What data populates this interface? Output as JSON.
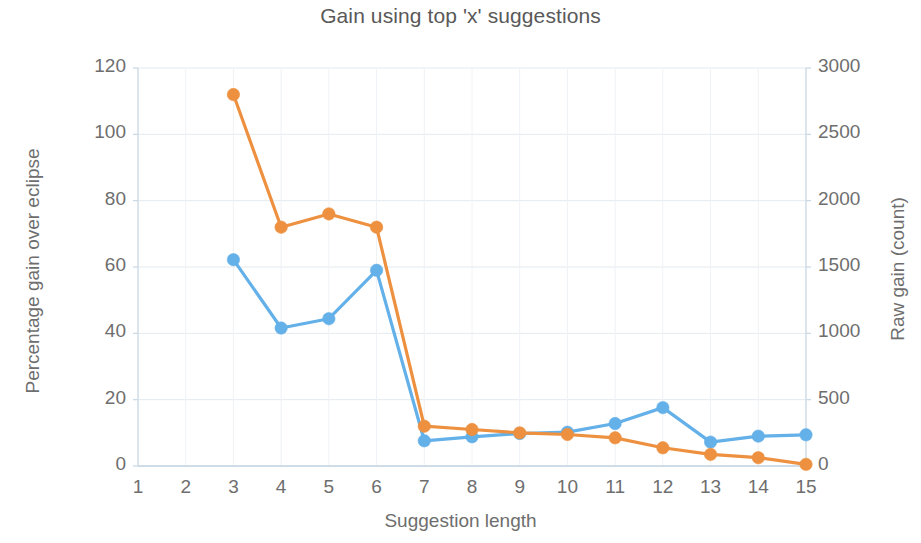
{
  "chart_data": {
    "type": "line",
    "title": "Gain using top 'x' suggestions",
    "xlabel": "Suggestion length",
    "ylabel": "Percentage gain over eclipse",
    "y2label": "Raw gain (count)",
    "x": [
      1,
      2,
      3,
      4,
      5,
      6,
      7,
      8,
      9,
      10,
      11,
      12,
      13,
      14,
      15
    ],
    "xticklabels": [
      "1",
      "2",
      "3",
      "4",
      "5",
      "6",
      "7",
      "8",
      "9",
      "10",
      "11",
      "12",
      "13",
      "14",
      "15"
    ],
    "xlim": [
      1,
      15
    ],
    "ylim": [
      0,
      120
    ],
    "yticks": [
      0,
      20,
      40,
      60,
      80,
      100,
      120
    ],
    "yticklabels": [
      "0",
      "20",
      "40",
      "60",
      "80",
      "100",
      "120"
    ],
    "y2lim": [
      0,
      3000
    ],
    "y2ticks": [
      0,
      500,
      1000,
      1500,
      2000,
      2500,
      3000
    ],
    "y2ticklabels": [
      "0",
      "500",
      "1000",
      "1500",
      "2000",
      "2500",
      "3000"
    ],
    "grid": true,
    "legend": "none",
    "series": [
      {
        "name": "Percentage gain over eclipse",
        "axis": "left",
        "color": "#ED9140",
        "x": [
          3,
          4,
          5,
          6,
          7,
          8,
          9,
          10,
          11,
          12,
          13,
          14,
          15
        ],
        "values": [
          112,
          72,
          76,
          72,
          12,
          11,
          10,
          9.5,
          8.5,
          5.5,
          3.5,
          2.5,
          0.5
        ]
      },
      {
        "name": "Raw gain (count)",
        "axis": "right",
        "color": "#64B0E8",
        "x": [
          3,
          4,
          5,
          6,
          7,
          8,
          9,
          10,
          11,
          12,
          13,
          14,
          15
        ],
        "values": [
          1555,
          1040,
          1110,
          1475,
          190,
          220,
          245,
          255,
          320,
          440,
          180,
          225,
          235
        ]
      }
    ]
  }
}
